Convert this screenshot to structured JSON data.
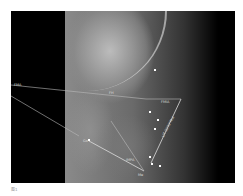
{
  "figure": {
    "labels": {
      "fma_left": "FMA",
      "fmia": "FMIA",
      "impa": "IMPA",
      "lit": "LIT 0270°Mol",
      "go": "Go",
      "me": "Me",
      "fh": "FH"
    },
    "caption": "图1"
  }
}
